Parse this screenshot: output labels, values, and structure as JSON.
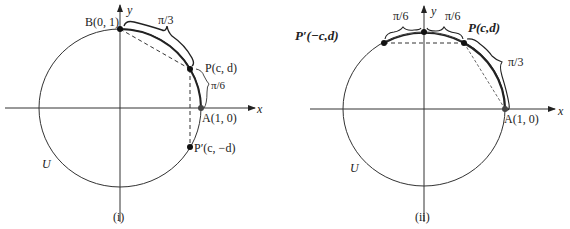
{
  "figures": [
    {
      "id": "i",
      "caption": "(i)",
      "circle_label": "U",
      "axis_x": "x",
      "axis_y": "y",
      "points": {
        "B": "B(0, 1)",
        "P": "P(c, d)",
        "A": "A(1, 0)",
        "P_prime": "P′(c, −d)"
      },
      "arcs": {
        "B_to_P": "π/3",
        "P_to_A": "π/6"
      }
    },
    {
      "id": "ii",
      "caption": "(ii)",
      "circle_label": "U",
      "axis_x": "x",
      "axis_y": "y",
      "points": {
        "P_prime": "P′(−c,d)",
        "P": "P(c,d)",
        "A": "A(1, 0)"
      },
      "arcs": {
        "P_prime_to_top": "π/6",
        "top_to_P": "π/6",
        "P_to_A": "π/3"
      }
    }
  ],
  "colors": {
    "ink": "#222222",
    "background": "#ffffff"
  }
}
